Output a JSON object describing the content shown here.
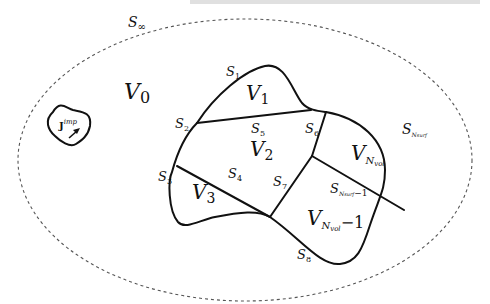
{
  "figure": {
    "top_cut_text": "…",
    "outer_boundary": {
      "label": "S",
      "sub": "∞"
    },
    "source": {
      "label": "J",
      "sup": "imp"
    },
    "volumes": [
      {
        "id": "V0",
        "label": "V",
        "sub": "0"
      },
      {
        "id": "V1",
        "label": "V",
        "sub": "1"
      },
      {
        "id": "V2",
        "label": "V",
        "sub": "2"
      },
      {
        "id": "V3",
        "label": "V",
        "sub": "3"
      },
      {
        "id": "VNvol",
        "label": "V",
        "sub": "N",
        "subsub": "vol"
      },
      {
        "id": "VNvol-1",
        "label": "V",
        "sub": "N",
        "subsub": "vol",
        "suffix": "−1"
      }
    ],
    "surfaces": [
      {
        "id": "S1",
        "label": "S",
        "sub": "1"
      },
      {
        "id": "S2",
        "label": "S",
        "sub": "2"
      },
      {
        "id": "S3",
        "label": "S",
        "sub": "3"
      },
      {
        "id": "S4",
        "label": "S",
        "sub": "4"
      },
      {
        "id": "S5",
        "label": "S",
        "sub": "5"
      },
      {
        "id": "S6",
        "label": "S",
        "sub": "6"
      },
      {
        "id": "S7",
        "label": "S",
        "sub": "7"
      },
      {
        "id": "S8",
        "label": "S",
        "sub": "8"
      },
      {
        "id": "SNsurf",
        "label": "S",
        "sub": "N",
        "subsub": "surf"
      },
      {
        "id": "SNsurf-1",
        "label": "S",
        "sub": "N",
        "subsub": "surf",
        "suffix": "−1"
      }
    ]
  }
}
